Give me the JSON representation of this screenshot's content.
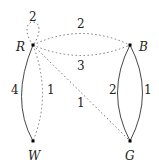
{
  "graph": {
    "vertices": [
      {
        "id": "R",
        "label": "R",
        "x": 33,
        "y": 45
      },
      {
        "id": "B",
        "label": "B",
        "x": 130,
        "y": 45
      },
      {
        "id": "W",
        "label": "W",
        "x": 33,
        "y": 141
      },
      {
        "id": "G",
        "label": "G",
        "x": 130,
        "y": 141
      }
    ],
    "edges": [
      {
        "from": "R",
        "to": "R",
        "style": "dotted",
        "kind": "loop",
        "weight": "2"
      },
      {
        "from": "R",
        "to": "B",
        "style": "dotted",
        "kind": "upper-arc",
        "weight": "2"
      },
      {
        "from": "R",
        "to": "B",
        "style": "dotted",
        "kind": "lower-arc",
        "weight": "3"
      },
      {
        "from": "R",
        "to": "W",
        "style": "solid",
        "kind": "left-arc",
        "weight": "4"
      },
      {
        "from": "R",
        "to": "W",
        "style": "dotted",
        "kind": "right-arc",
        "weight": "1"
      },
      {
        "from": "R",
        "to": "G",
        "style": "dotted",
        "kind": "diagonal",
        "weight": "1"
      },
      {
        "from": "B",
        "to": "G",
        "style": "solid",
        "kind": "left-arc",
        "weight": "2"
      },
      {
        "from": "B",
        "to": "G",
        "style": "solid",
        "kind": "right-arc",
        "weight": "1"
      }
    ]
  }
}
